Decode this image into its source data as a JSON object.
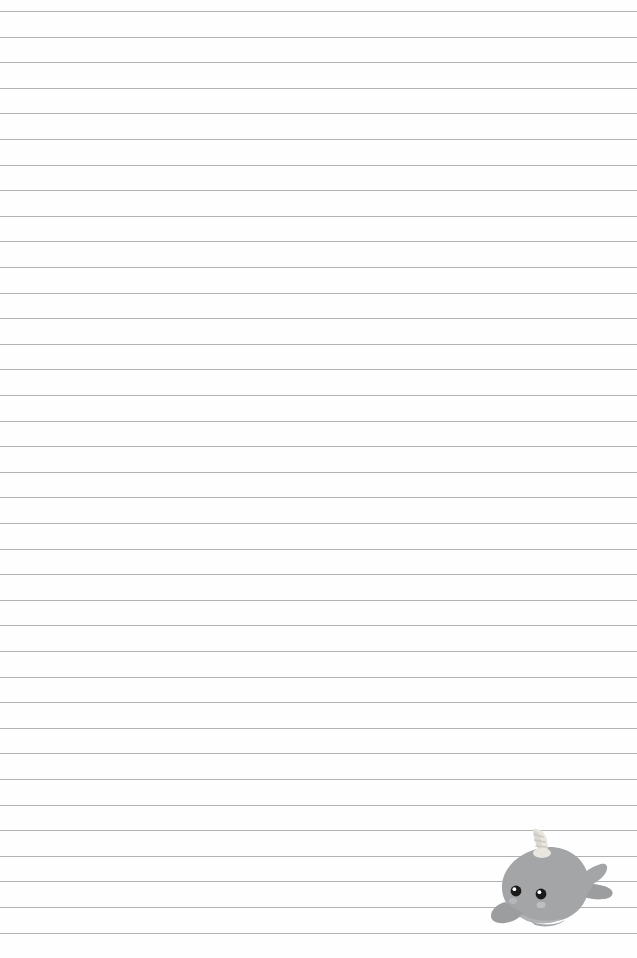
{
  "page": {
    "width": 637,
    "height": 958,
    "background_color": "#fefefe",
    "paper_type": "college-ruled-lined-paper"
  },
  "rules": {
    "name": "horizontal-ruled-lines",
    "line_color": "#a9abad",
    "line_thickness_px": 1,
    "first_line_y": 11,
    "spacing_px": 25.6,
    "line_count": 37,
    "left_margin_x": 0,
    "right_margin_x": 637,
    "full_bleed": true,
    "positions": [
      11,
      36.6,
      62.2,
      87.8,
      113.4,
      139,
      164.6,
      190.2,
      215.8,
      241.4,
      267,
      292.6,
      318.2,
      343.8,
      369.4,
      395,
      420.6,
      446.2,
      471.8,
      497.4,
      523,
      548.6,
      574.2,
      599.8,
      625.4,
      651,
      676.6,
      702.2,
      727.8,
      753.4,
      779,
      804.6,
      830.2,
      855.8,
      881.4,
      907,
      932.6
    ]
  },
  "decoration": {
    "name": "narwhal-illustration",
    "description": "kawaii cartoon narwhal",
    "position": {
      "left": 489,
      "top": 828
    },
    "size": {
      "width": 132,
      "height": 104
    },
    "colors": {
      "body": "#a3a5a7",
      "body_shade": "#969899",
      "body_light": "#b4b6b8",
      "tusk": "#e8e6df",
      "tusk_shade": "#d4d2ca",
      "eye": "#1a1a1a",
      "eye_highlight": "#ffffff",
      "cheek": "#c2c4c6",
      "outline": "#8e9092"
    },
    "parts": [
      {
        "name": "tusk",
        "label": "spiral horn"
      },
      {
        "name": "head-body",
        "label": "rounded body"
      },
      {
        "name": "left-eye",
        "label": "left eye"
      },
      {
        "name": "right-eye",
        "label": "right eye"
      },
      {
        "name": "left-cheek",
        "label": "left cheek blush"
      },
      {
        "name": "right-cheek",
        "label": "right cheek blush"
      },
      {
        "name": "front-flipper",
        "label": "front flipper"
      },
      {
        "name": "belly",
        "label": "belly"
      },
      {
        "name": "tail-fluke",
        "label": "tail fluke"
      }
    ]
  }
}
